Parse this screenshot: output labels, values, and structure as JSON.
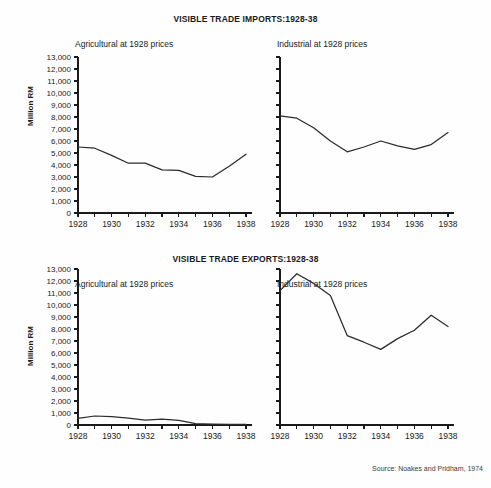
{
  "figure": {
    "source_note": "Source: Noakes and Pridham, 1974",
    "ylabel": "Million RM",
    "panel_left_label": "Agricultural at 1928 prices",
    "panel_right_label": "Industrial at 1928 prices",
    "line_color": "#2b2b2b",
    "axis_color": "#1a1a1a",
    "background": "#ffffff"
  },
  "chart_data": [
    {
      "type": "line",
      "title": "VISIBLE TRADE IMPORTS:1928-38",
      "subtitle": "Agricultural at 1928 prices",
      "xlabel": "",
      "ylabel": "Million RM",
      "x": [
        1928,
        1929,
        1930,
        1931,
        1932,
        1933,
        1934,
        1935,
        1936,
        1937,
        1938
      ],
      "values": [
        5500,
        5400,
        4800,
        4150,
        4150,
        3600,
        3550,
        3050,
        3000,
        3900,
        4900
      ],
      "xlim": [
        1928,
        1938
      ],
      "ylim": [
        0,
        13000
      ],
      "ytick_labels": [
        "0",
        "1,000",
        "2,000",
        "3,000",
        "4,000",
        "5,000",
        "6,000",
        "7,000",
        "8,000",
        "9,000",
        "10,000",
        "11,000",
        "12,000",
        "13,000"
      ],
      "xtick_labels": [
        "1928",
        "1930",
        "1932",
        "1934",
        "1936",
        "1938"
      ],
      "grid": false,
      "legend": "none"
    },
    {
      "type": "line",
      "title": "VISIBLE TRADE IMPORTS:1928-38",
      "subtitle": "Industrial at 1928 prices",
      "xlabel": "",
      "ylabel": "Million RM",
      "x": [
        1928,
        1929,
        1930,
        1931,
        1932,
        1933,
        1934,
        1935,
        1936,
        1937,
        1938
      ],
      "values": [
        8100,
        7900,
        7100,
        6000,
        5100,
        5500,
        6000,
        5600,
        5300,
        5700,
        6700
      ],
      "xlim": [
        1928,
        1938
      ],
      "ylim": [
        0,
        13000
      ],
      "ytick_labels": [
        "0",
        "1,000",
        "2,000",
        "3,000",
        "4,000",
        "5,000",
        "6,000",
        "7,000",
        "8,000",
        "9,000",
        "10,000",
        "11,000",
        "12,000",
        "13,000"
      ],
      "xtick_labels": [
        "1928",
        "1930",
        "1932",
        "1934",
        "1936",
        "1938"
      ],
      "grid": false,
      "legend": "none"
    },
    {
      "type": "line",
      "title": "VISIBLE TRADE EXPORTS:1928-38",
      "subtitle": "Agricultural at 1928 prices",
      "xlabel": "",
      "ylabel": "Million RM",
      "x": [
        1928,
        1929,
        1930,
        1931,
        1932,
        1933,
        1934,
        1935,
        1936,
        1937,
        1938
      ],
      "values": [
        550,
        750,
        700,
        580,
        400,
        480,
        380,
        120,
        80,
        60,
        50
      ],
      "xlim": [
        1928,
        1938
      ],
      "ylim": [
        0,
        13000
      ],
      "ytick_labels": [
        "0",
        "1,000",
        "2,000",
        "3,000",
        "4,000",
        "5,000",
        "6,000",
        "7,000",
        "8,000",
        "9,000",
        "10,000",
        "11,000",
        "12,000",
        "13,000"
      ],
      "xtick_labels": [
        "1928",
        "1930",
        "1932",
        "1934",
        "1936",
        "1938"
      ],
      "grid": false,
      "legend": "none"
    },
    {
      "type": "line",
      "title": "VISIBLE TRADE EXPORTS:1928-38",
      "subtitle": "Industrial at 1928 prices",
      "xlabel": "",
      "ylabel": "Million RM",
      "x": [
        1928,
        1929,
        1930,
        1931,
        1932,
        1933,
        1934,
        1935,
        1936,
        1937,
        1938
      ],
      "values": [
        11200,
        12600,
        11800,
        10800,
        7450,
        6900,
        6300,
        7200,
        7900,
        9150,
        8200
      ],
      "xlim": [
        1928,
        1938
      ],
      "ylim": [
        0,
        13000
      ],
      "ytick_labels": [
        "0",
        "1,000",
        "2,000",
        "3,000",
        "4,000",
        "5,000",
        "6,000",
        "7,000",
        "8,000",
        "9,000",
        "10,000",
        "11,000",
        "12,000",
        "13,000"
      ],
      "xtick_labels": [
        "1928",
        "1930",
        "1932",
        "1934",
        "1936",
        "1938"
      ],
      "grid": false,
      "legend": "none"
    }
  ]
}
